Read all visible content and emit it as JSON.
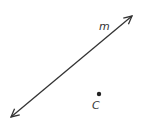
{
  "diagram": {
    "line": {
      "label": "m",
      "from": [
        11,
        117
      ],
      "to": [
        132,
        16
      ],
      "color": "#333333",
      "arrows": "both"
    },
    "point": {
      "label": "C",
      "position": [
        99,
        94
      ],
      "color": "#333333"
    }
  }
}
